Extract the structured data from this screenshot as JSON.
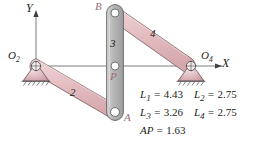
{
  "figure": {
    "type": "fourbar-linkage-diagram",
    "axes": {
      "x_label": "X",
      "y_label": "Y"
    },
    "joints": [
      {
        "name": "O2",
        "label": "O",
        "sub": "2",
        "x": 36,
        "y": 66,
        "kind": "ground-pivot"
      },
      {
        "name": "O4",
        "label": "O",
        "sub": "4",
        "x": 191,
        "y": 66,
        "kind": "ground-pivot"
      },
      {
        "name": "A",
        "label": "A",
        "sub": "",
        "x": 115,
        "y": 112,
        "kind": "pin"
      },
      {
        "name": "B",
        "label": "B",
        "sub": "",
        "x": 115,
        "y": 13,
        "kind": "pin"
      },
      {
        "name": "P",
        "label": "P",
        "sub": "",
        "x": 115,
        "y": 66,
        "kind": "coupler-point"
      }
    ],
    "links": [
      {
        "number": "2",
        "label_x": 72,
        "label_y": 92,
        "color": "#e8c3c6",
        "from": "O2",
        "to": "A"
      },
      {
        "number": "3",
        "label_x": 109,
        "label_y": 43,
        "color": "#b5b5b5",
        "from": "B",
        "to": "A"
      },
      {
        "number": "4",
        "label_x": 152,
        "label_y": 33,
        "color": "#e8c3c6",
        "from": "B",
        "to": "O4"
      }
    ],
    "dimensions": [
      [
        {
          "symbol": "L",
          "sub": "1",
          "value": "4.43"
        },
        {
          "symbol": "L",
          "sub": "2",
          "value": "2.75"
        }
      ],
      [
        {
          "symbol": "L",
          "sub": "3",
          "value": "3.26"
        },
        {
          "symbol": "L",
          "sub": "4",
          "value": "2.75"
        }
      ],
      [
        {
          "symbol": "AP",
          "sub": "",
          "value": "1.63"
        }
      ]
    ],
    "colors": {
      "link_pink": "#e8c3c6",
      "link_pink_edge": "#8a6f72",
      "link_gray": "#b5b5b5",
      "link_gray_edge": "#6f6f6f",
      "ground_pink": "#e3bfc2",
      "text": "#231f20",
      "axis": "#555555",
      "pink_label": "#b56a72"
    }
  }
}
